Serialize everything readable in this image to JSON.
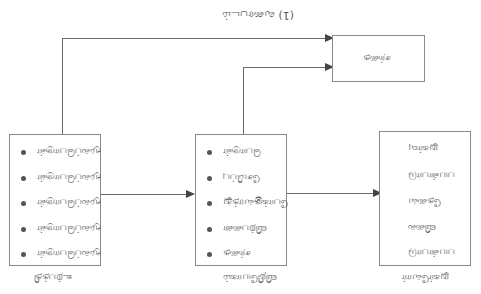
{
  "diagram": {
    "title": "(1) வரைபடம்",
    "top_box": {
      "label": "சந்தை"
    },
    "left_box": {
      "caption": "உற்பத்தி",
      "items": [
        "மூலப்பொருள்",
        "மூலப்பொருள்",
        "மூலப்பொருள்",
        "மூலப்பொருள்",
        "மூலப்பொருள்"
      ]
    },
    "middle_box": {
      "caption": "விநியோகம்",
      "items": [
        "பொருள்",
        "சேமிப்பு",
        "போக்குவரத்து",
        "விற்பனை",
        "சந்தை"
      ]
    },
    "right_box": {
      "caption": "நுகர்வோர்",
      "items": [
        "நுகர்வு",
        "பயன்பாடு",
        "தேவை",
        "விலை",
        "பயன்பாடு"
      ]
    },
    "colors": {
      "line": "#6a6a6a",
      "border": "#8a8a8a",
      "text": "#5a5a5a"
    }
  }
}
